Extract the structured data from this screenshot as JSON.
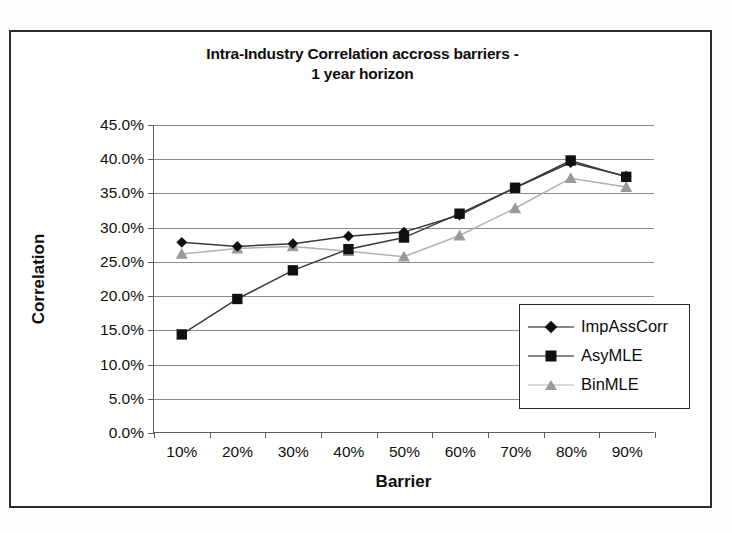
{
  "chart_data": {
    "type": "line",
    "title": "Intra-Industry Correlation accross barriers - 1 year horizon",
    "title_line1": "Intra-Industry Correlation accross barriers -",
    "title_line2": "1 year horizon",
    "xlabel": "Barrier",
    "ylabel": "Correlation",
    "categories": [
      "10%",
      "20%",
      "30%",
      "40%",
      "50%",
      "60%",
      "70%",
      "80%",
      "90%"
    ],
    "x_tick_labels": [
      "10%",
      "20%",
      "30%",
      "40%",
      "50%",
      "60%",
      "70%",
      "80%",
      "90%"
    ],
    "y_tick_labels": [
      "0.0%",
      "5.0%",
      "10.0%",
      "15.0%",
      "20.0%",
      "25.0%",
      "30.0%",
      "35.0%",
      "40.0%",
      "45.0%"
    ],
    "y_tick_values": [
      0,
      5,
      10,
      15,
      20,
      25,
      30,
      35,
      40,
      45
    ],
    "ylim": [
      0,
      45
    ],
    "grid": true,
    "legend_position": "center-right",
    "series": [
      {
        "name": "ImpAssCorr",
        "marker": "diamond",
        "color": "#101010",
        "values": [
          27.8,
          27.2,
          27.6,
          28.7,
          29.3,
          31.8,
          35.8,
          39.5,
          37.5
        ]
      },
      {
        "name": "AsyMLE",
        "marker": "square",
        "color": "#101010",
        "values": [
          14.3,
          19.5,
          23.7,
          26.8,
          28.5,
          32.0,
          35.8,
          39.8,
          37.4
        ]
      },
      {
        "name": "BinMLE",
        "marker": "triangle",
        "color": "#9a9a9a",
        "values": [
          26.1,
          26.9,
          27.2,
          26.5,
          25.7,
          28.8,
          32.8,
          37.2,
          35.9
        ]
      }
    ]
  },
  "legend": {
    "items": [
      {
        "label": "ImpAssCorr"
      },
      {
        "label": "AsyMLE"
      },
      {
        "label": "BinMLE"
      }
    ]
  },
  "colors": {
    "frame": "#2b2b2b",
    "gridline": "#8a8a8a",
    "axis": "#5d5d5d",
    "dark_series": "#101010",
    "light_series": "#9a9a9a",
    "background": "#ffffff"
  }
}
